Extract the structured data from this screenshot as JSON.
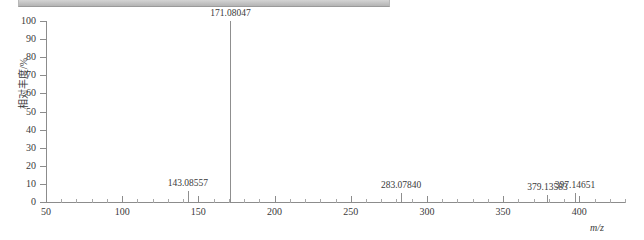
{
  "top_bar": {
    "name": "window-chrome-strip"
  },
  "chart_data": {
    "type": "bar",
    "title": "",
    "subtitle": "",
    "xlabel": "m/z",
    "ylabel": "相对丰度/%",
    "xlim": [
      50,
      430
    ],
    "ylim": [
      0,
      100
    ],
    "grid": false,
    "legend": null,
    "x_major_step": 50,
    "x_minor_step": 10,
    "y_major_step": 10,
    "x_ticks": [
      50,
      100,
      150,
      200,
      250,
      300,
      350,
      400
    ],
    "y_ticks": [
      0,
      10,
      20,
      30,
      40,
      50,
      60,
      70,
      80,
      90,
      100
    ],
    "x": [
      143.08557,
      171.08047,
      283.0784,
      379.13583,
      397.14651
    ],
    "values": [
      6,
      100,
      5,
      4,
      5
    ],
    "peaks": [
      {
        "mz": 143.08557,
        "label": "143.08557",
        "intensity": 6
      },
      {
        "mz": 171.08047,
        "label": "171.08047",
        "intensity": 100
      },
      {
        "mz": 283.0784,
        "label": "283.07840",
        "intensity": 5
      },
      {
        "mz": 379.13583,
        "label": "379.13583",
        "intensity": 4
      },
      {
        "mz": 397.14651,
        "label": "397.14651",
        "intensity": 5
      }
    ],
    "colors": {
      "peak": "#8f8f8f",
      "axis": "#8c8c8c",
      "text": "#3a3a3a",
      "background": "#ffffff"
    }
  }
}
